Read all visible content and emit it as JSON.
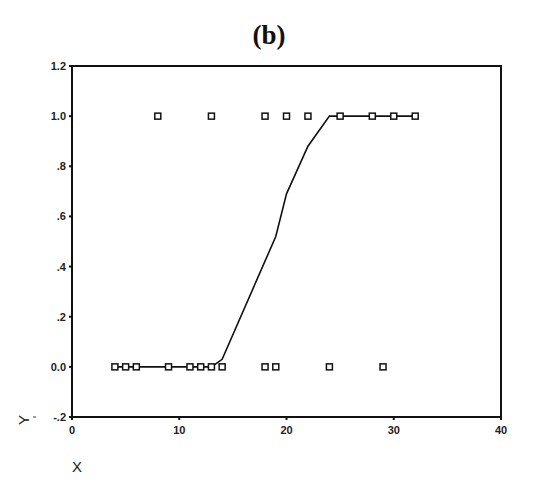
{
  "chart_data": {
    "type": "scatter",
    "title": "(b)",
    "xlabel": "X",
    "ylabel": "Y",
    "xlim": [
      0,
      40
    ],
    "ylim": [
      -0.2,
      1.2
    ],
    "x_ticks": [
      "0",
      "10",
      "20",
      "30",
      "40"
    ],
    "x_tick_values": [
      0,
      10,
      20,
      30,
      40
    ],
    "y_ticks": [
      "1.2",
      "1.0",
      ".8",
      ".6",
      ".4",
      ".2",
      "0.0",
      "-.2"
    ],
    "y_tick_values": [
      1.2,
      1.0,
      0.8,
      0.6,
      0.4,
      0.2,
      0.0,
      -0.2
    ],
    "grid": false,
    "legend": null,
    "series": [
      {
        "name": "observed",
        "type": "scatter",
        "marker": "square",
        "points": [
          [
            4,
            0
          ],
          [
            5,
            0
          ],
          [
            6,
            0
          ],
          [
            9,
            0
          ],
          [
            11,
            0
          ],
          [
            12,
            0
          ],
          [
            13,
            0
          ],
          [
            14,
            0
          ],
          [
            18,
            0
          ],
          [
            19,
            0
          ],
          [
            24,
            0
          ],
          [
            29,
            0
          ],
          [
            8,
            1
          ],
          [
            13,
            1
          ],
          [
            18,
            1
          ],
          [
            20,
            1
          ],
          [
            22,
            1
          ],
          [
            25,
            1
          ],
          [
            28,
            1
          ],
          [
            30,
            1
          ],
          [
            32,
            1
          ]
        ]
      },
      {
        "name": "fitted",
        "type": "line",
        "points": [
          [
            4,
            0
          ],
          [
            13,
            0
          ],
          [
            14,
            0.03
          ],
          [
            19,
            0.52
          ],
          [
            20,
            0.69
          ],
          [
            22,
            0.88
          ],
          [
            24,
            1.0
          ],
          [
            32,
            1.0
          ]
        ]
      }
    ]
  }
}
